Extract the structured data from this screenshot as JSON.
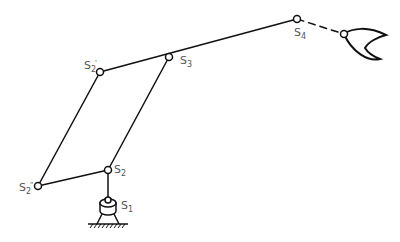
{
  "diagram": {
    "type": "kinematic-linkage",
    "colors": {
      "line": "#111111",
      "label": "#555555",
      "background": "#ffffff"
    },
    "joints": [
      {
        "id": "S1",
        "label": "S",
        "sub": "1",
        "prime": "",
        "x": 108,
        "y": 208
      },
      {
        "id": "S2",
        "label": "S",
        "sub": "2",
        "prime": "",
        "x": 108,
        "y": 170
      },
      {
        "id": "S2pp",
        "label": "S",
        "sub": "2",
        "prime": "\"",
        "x": 38,
        "y": 186
      },
      {
        "id": "S2p",
        "label": "S",
        "sub": "2",
        "prime": "'",
        "x": 100,
        "y": 72
      },
      {
        "id": "S3",
        "label": "S",
        "sub": "3",
        "prime": "",
        "x": 169,
        "y": 57
      },
      {
        "id": "S4",
        "label": "S",
        "sub": "4",
        "prime": "",
        "x": 297,
        "y": 19
      },
      {
        "id": "G",
        "label": "",
        "sub": "",
        "prime": "",
        "x": 344,
        "y": 34
      }
    ],
    "links": [
      {
        "from": "S2",
        "to": "S2pp",
        "style": "solid"
      },
      {
        "from": "S2pp",
        "to": "S2p",
        "style": "solid"
      },
      {
        "from": "S2",
        "to": "S3",
        "style": "solid"
      },
      {
        "from": "S2p",
        "to": "S4",
        "style": "solid"
      },
      {
        "from": "S4",
        "to": "G",
        "style": "dashed"
      },
      {
        "from": "S2",
        "to": "S1",
        "style": "solid"
      }
    ],
    "labels": {
      "s1": {
        "main": "S",
        "sub": "1",
        "prime": ""
      },
      "s2": {
        "main": "S",
        "sub": "2",
        "prime": ""
      },
      "s2pp": {
        "main": "S",
        "sub": "2",
        "prime": "\""
      },
      "s2p": {
        "main": "S",
        "sub": "2",
        "prime": "'"
      },
      "s3": {
        "main": "S",
        "sub": "3",
        "prime": ""
      },
      "s4": {
        "main": "S",
        "sub": "4",
        "prime": ""
      }
    },
    "end_effector": "gripper"
  }
}
